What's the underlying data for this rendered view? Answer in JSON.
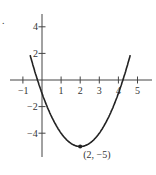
{
  "figure_marker": ".",
  "chart_data": {
    "type": "line",
    "title": "",
    "function": "y = (x - 2)^2 - 5",
    "xlabel": "",
    "ylabel": "",
    "xlim": [
      -1.3,
      5.4
    ],
    "ylim": [
      -5.8,
      5.5
    ],
    "x_ticks": [
      -1,
      1,
      2,
      3,
      4,
      5
    ],
    "y_ticks": [
      4,
      2,
      -2,
      -4
    ],
    "x_tick_labels": [
      "−1",
      "1",
      "2",
      "3",
      "4",
      "5"
    ],
    "y_tick_labels": [
      "4",
      "2",
      "−2",
      "−4"
    ],
    "series": [
      {
        "name": "parabola",
        "x": [
          -0.6,
          -0.5,
          0,
          0.5,
          1,
          1.5,
          2,
          2.5,
          3,
          3.5,
          4,
          4.5,
          4.6
        ],
        "y": [
          1.76,
          1.25,
          -1,
          -2.75,
          -4,
          -4.75,
          -5,
          -4.75,
          -4,
          -2.75,
          -1,
          1.25,
          1.76
        ]
      }
    ],
    "annotations": [
      {
        "x": 2,
        "y": -5,
        "text": "(2, −5)",
        "marker": "dot"
      }
    ],
    "grid": false,
    "legend": "none"
  }
}
